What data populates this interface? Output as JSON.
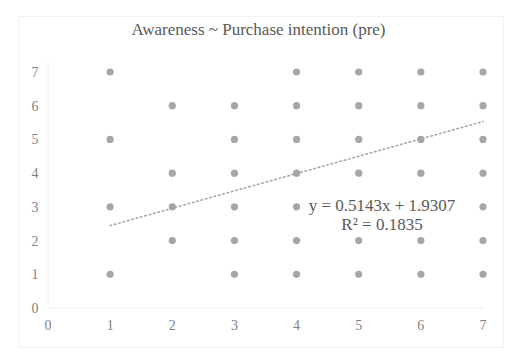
{
  "chart_data": {
    "type": "scatter",
    "title": "Awareness ~ Purchase intention (pre)",
    "xlabel": "",
    "ylabel": "",
    "xlim": [
      0,
      7
    ],
    "ylim": [
      0,
      7
    ],
    "x_ticks": [
      0,
      1,
      2,
      3,
      4,
      5,
      6,
      7
    ],
    "y_ticks": [
      0,
      1,
      2,
      3,
      4,
      5,
      6,
      7
    ],
    "grid": false,
    "legend": null,
    "marker_color": "#a6a6a6",
    "series": [
      {
        "name": "observations",
        "points": [
          [
            1,
            7
          ],
          [
            1,
            5
          ],
          [
            1,
            3
          ],
          [
            1,
            1
          ],
          [
            2,
            6
          ],
          [
            2,
            4
          ],
          [
            2,
            3
          ],
          [
            2,
            2
          ],
          [
            3,
            6
          ],
          [
            3,
            5
          ],
          [
            3,
            4
          ],
          [
            3,
            3
          ],
          [
            3,
            2
          ],
          [
            3,
            1
          ],
          [
            4,
            7
          ],
          [
            4,
            6
          ],
          [
            4,
            5
          ],
          [
            4,
            4
          ],
          [
            4,
            3
          ],
          [
            4,
            2
          ],
          [
            4,
            1
          ],
          [
            5,
            7
          ],
          [
            5,
            6
          ],
          [
            5,
            5
          ],
          [
            5,
            4
          ],
          [
            5,
            3
          ],
          [
            5,
            2
          ],
          [
            5,
            1
          ],
          [
            6,
            7
          ],
          [
            6,
            6
          ],
          [
            6,
            5
          ],
          [
            6,
            4
          ],
          [
            6,
            3
          ],
          [
            6,
            2
          ],
          [
            6,
            1
          ],
          [
            7,
            7
          ],
          [
            7,
            6
          ],
          [
            7,
            5
          ],
          [
            7,
            4
          ],
          [
            7,
            3
          ],
          [
            7,
            2
          ],
          [
            7,
            1
          ]
        ]
      }
    ],
    "trendline": {
      "type": "linear",
      "slope": 0.5143,
      "intercept": 1.9307,
      "x_range": [
        1,
        7
      ],
      "style": "dotted",
      "color": "#a6a6a6",
      "equation_label": "y = 0.5143x + 1.9307",
      "r_squared_label": "R² = 0.1835"
    }
  }
}
